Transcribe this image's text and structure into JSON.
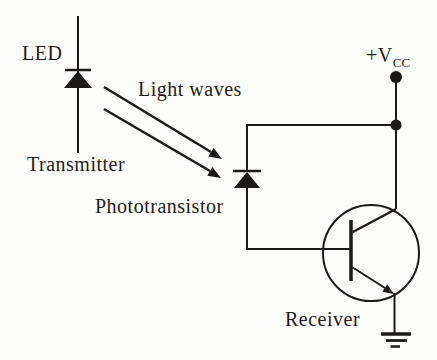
{
  "diagram": {
    "type": "circuit-schematic",
    "labels": {
      "led": "LED",
      "transmitter": "Transmitter",
      "light_waves": "Light waves",
      "phototransistor": "Phototransistor",
      "receiver": "Receiver",
      "vcc_main": "+V",
      "vcc_sub": "CC"
    },
    "components": [
      "led-diode",
      "light-wave-arrows",
      "phototransistor-diode",
      "npn-transistor",
      "vcc-terminal",
      "ground"
    ],
    "colors": {
      "ink": "#1c1a18",
      "background": "#fdfdfb"
    }
  }
}
